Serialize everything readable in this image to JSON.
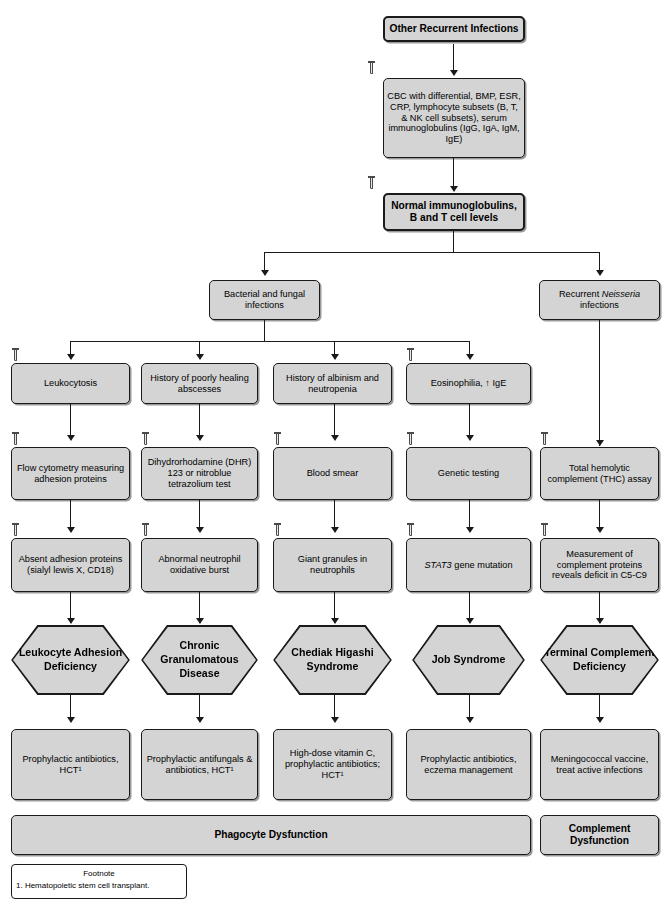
{
  "diagram": {
    "title": "Other Recurrent Infections",
    "icon_name": "test-tube-icon"
  },
  "nodes": {
    "root": "Other Recurrent Infections",
    "workup": "CBC with differential, BMP, ESR, CRP, lymphocyte subsets (B, T, & NK cell subsets), serum immunoglobulins (IgG, IgA, IgM, IgE)",
    "normal_labs": "Normal immunoglobulins, B and T cell levels",
    "branch_bacterial": "Bacterial and fungal infections",
    "branch_neisseria_pre": "Recurrent ",
    "branch_neisseria_it": "Neisseria",
    "branch_neisseria_post": " infections"
  },
  "columns": [
    {
      "id": "lad",
      "finding": "Leukocytosis",
      "test": "Flow cytometry measuring adhesion proteins",
      "result": "Absent adhesion proteins (sialyl lewis X, CD18)",
      "diagnosis": "Leukocyte Adhesion Deficiency",
      "treatment": "Prophylactic antibiotics, HCT¹"
    },
    {
      "id": "cgd",
      "finding": "History of poorly healing abscesses",
      "test": "Dihydrorhodamine (DHR) 123 or nitroblue tetrazolium test",
      "result": "Abnormal neutrophil oxidative burst",
      "diagnosis": "Chronic Granulomatous Disease",
      "treatment": "Prophylactic antifungals & antibiotics, HCT¹"
    },
    {
      "id": "chs",
      "finding": "History of albinism and neutropenia",
      "test": "Blood smear",
      "result": "Giant granules in neutrophils",
      "diagnosis": "Chediak Higashi Syndrome",
      "treatment": "High-dose vitamin C, prophylactic antibiotics; HCT¹"
    },
    {
      "id": "job",
      "finding": "Eosinophilia, ↑ IgE",
      "test": "Genetic testing",
      "result_pre": "",
      "result_it": "STAT3",
      "result_post": " gene mutation",
      "result": "STAT3 gene mutation",
      "diagnosis": "Job Syndrome",
      "treatment": "Prophylactic antibiotics, eczema management"
    },
    {
      "id": "tcd",
      "finding": "",
      "test": "Total hemolytic complement (THC) assay",
      "result": "Measurement of complement proteins reveals deficit in C5-C9",
      "diagnosis": "Terminal Complement Deficiency",
      "treatment": "Meningococcal vaccine, treat active infections"
    }
  ],
  "summary": {
    "phagocyte": "Phagocyte Dysfunction",
    "complement": "Complement Dysfunction"
  },
  "footnote": {
    "title": "Footnote",
    "item1": "1. Hematopoietic stem cell transplant."
  },
  "colors": {
    "node_fill": "#d4d4d4",
    "node_border": "#1a1a1a",
    "page_bg": "#ffffff"
  }
}
